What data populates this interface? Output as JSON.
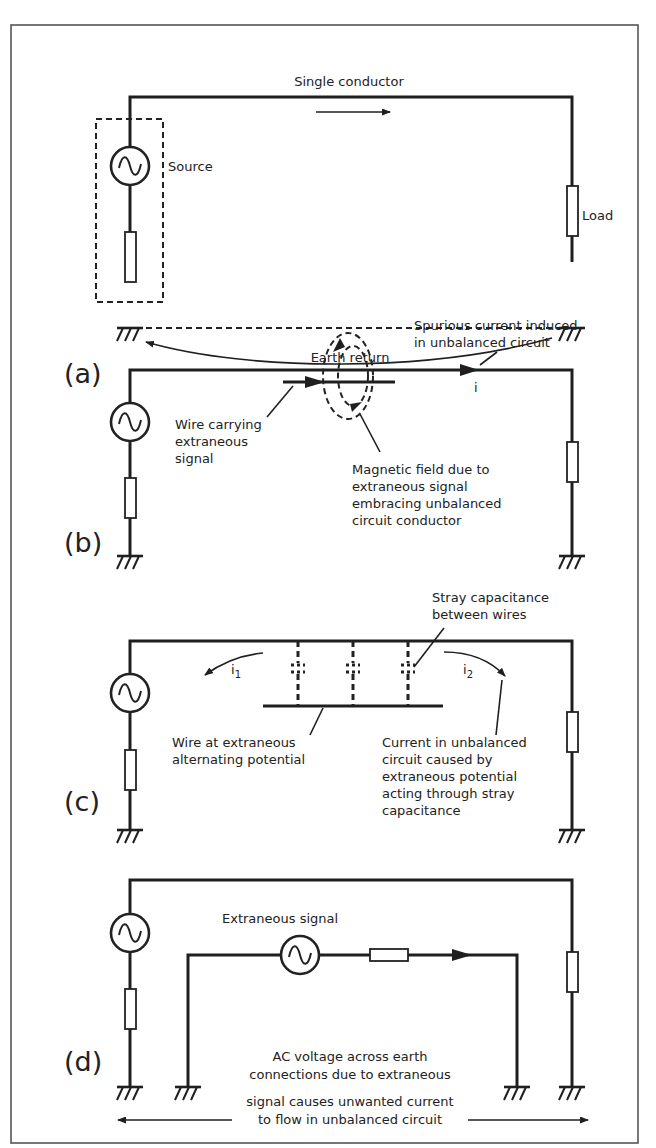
{
  "figure": {
    "panels": [
      {
        "id": "a",
        "letter": "(a)",
        "labels": {
          "conductor": "Single conductor",
          "source": "Source",
          "load": "Load",
          "earth_return": "Earth return"
        }
      },
      {
        "id": "b",
        "letter": "(b)",
        "labels": {
          "spurious_1": "Spurious current induced",
          "spurious_2": "in unbalanced circuit",
          "current_symbol": "i",
          "wire_1": "Wire carrying",
          "wire_2": "extraneous",
          "wire_3": "signal",
          "field_1": "Magnetic field due to",
          "field_2": "extraneous signal",
          "field_3": "embracing unbalanced",
          "field_4": "circuit conductor"
        }
      },
      {
        "id": "c",
        "letter": "(c)",
        "labels": {
          "stray_1": "Stray capacitance",
          "stray_2": "between wires",
          "i1": "i",
          "i1_sub": "1",
          "i2": "i",
          "i2_sub": "2",
          "wire_1": "Wire at extraneous",
          "wire_2": "alternating potential",
          "current_1": "Current in unbalanced",
          "current_2": "circuit caused by",
          "current_3": "extraneous potential",
          "current_4": "acting through stray",
          "current_5": "capacitance"
        }
      },
      {
        "id": "d",
        "letter": "(d)",
        "labels": {
          "extraneous": "Extraneous signal",
          "note_1": "AC voltage across earth",
          "note_2": "connections due to extraneous",
          "note_3": "signal causes unwanted current",
          "note_4": "to flow in unbalanced circuit"
        }
      }
    ],
    "colors": {
      "ink": "#1f1f1f",
      "background": "#ffffff",
      "frame": "#555555"
    }
  }
}
